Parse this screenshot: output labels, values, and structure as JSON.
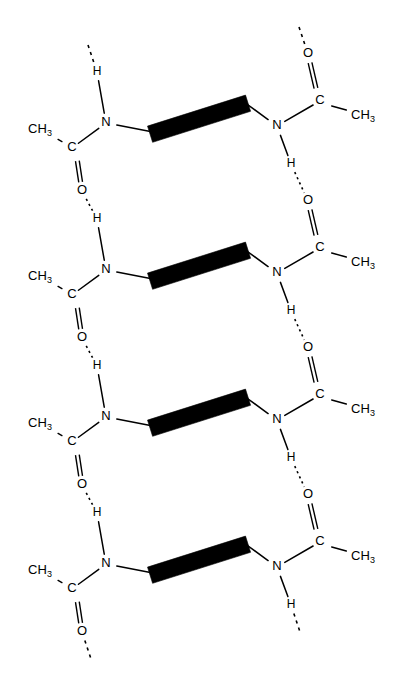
{
  "figure": {
    "background_color": "#ffffff",
    "stroke_color": "#000000",
    "width": 394,
    "height": 698
  },
  "labels": {
    "carbon": "C",
    "nitrogen": "N",
    "oxygen": "O",
    "hydrogen": "H",
    "methyl_stem": "CH",
    "methyl_sub": "3"
  },
  "legend": {
    "bold_bar": "peptide-backbone-bar",
    "dotted_line": "hydrogen-bond",
    "dashed_stub": "chain-continuation"
  },
  "geometry": {
    "unit_period_y": 147,
    "unit_count": 4,
    "left_column_x": 106,
    "right_column_x": 277,
    "bar_left_x": 148,
    "bar_right_x": 248
  },
  "units": [
    {
      "index": 1,
      "left": {
        "n": {
          "x": 106,
          "y": 123,
          "label": "N"
        },
        "h": {
          "x": 97,
          "y": 72,
          "label": "H"
        },
        "c": {
          "x": 72,
          "y": 148,
          "label": "C"
        },
        "ch3": {
          "x": 40,
          "y": 130,
          "label": "CH3"
        },
        "o": {
          "x": 82,
          "y": 191,
          "label": "O"
        }
      },
      "right": {
        "n": {
          "x": 277,
          "y": 126,
          "label": "N"
        },
        "h": {
          "x": 291,
          "y": 164,
          "label": "H"
        },
        "c": {
          "x": 320,
          "y": 101,
          "label": "C"
        },
        "ch3": {
          "x": 363,
          "y": 116,
          "label": "CH3"
        },
        "o": {
          "x": 308,
          "y": 54,
          "label": "O"
        }
      },
      "bar": {
        "x1": 149,
        "y1": 131,
        "x2": 247,
        "y2": 100
      }
    },
    {
      "index": 2,
      "left": {
        "n": {
          "x": 106,
          "y": 270,
          "label": "N"
        },
        "h": {
          "x": 97,
          "y": 219,
          "label": "H"
        },
        "c": {
          "x": 72,
          "y": 295,
          "label": "C"
        },
        "ch3": {
          "x": 40,
          "y": 277,
          "label": "CH3"
        },
        "o": {
          "x": 82,
          "y": 338,
          "label": "O"
        }
      },
      "right": {
        "n": {
          "x": 277,
          "y": 273,
          "label": "N"
        },
        "h": {
          "x": 291,
          "y": 311,
          "label": "H"
        },
        "c": {
          "x": 320,
          "y": 248,
          "label": "C"
        },
        "ch3": {
          "x": 363,
          "y": 263,
          "label": "CH3"
        },
        "o": {
          "x": 308,
          "y": 201,
          "label": "O"
        }
      },
      "bar": {
        "x1": 149,
        "y1": 278,
        "x2": 247,
        "y2": 247
      }
    },
    {
      "index": 3,
      "left": {
        "n": {
          "x": 106,
          "y": 417,
          "label": "N"
        },
        "h": {
          "x": 97,
          "y": 366,
          "label": "H"
        },
        "c": {
          "x": 72,
          "y": 442,
          "label": "C"
        },
        "ch3": {
          "x": 40,
          "y": 424,
          "label": "CH3"
        },
        "o": {
          "x": 82,
          "y": 485,
          "label": "O"
        }
      },
      "right": {
        "n": {
          "x": 277,
          "y": 420,
          "label": "N"
        },
        "h": {
          "x": 291,
          "y": 458,
          "label": "H"
        },
        "c": {
          "x": 320,
          "y": 395,
          "label": "C"
        },
        "ch3": {
          "x": 363,
          "y": 410,
          "label": "CH3"
        },
        "o": {
          "x": 308,
          "y": 348,
          "label": "O"
        }
      },
      "bar": {
        "x1": 149,
        "y1": 425,
        "x2": 247,
        "y2": 394
      }
    },
    {
      "index": 4,
      "left": {
        "n": {
          "x": 106,
          "y": 564,
          "label": "N"
        },
        "h": {
          "x": 97,
          "y": 513,
          "label": "H"
        },
        "c": {
          "x": 72,
          "y": 589,
          "label": "C"
        },
        "ch3": {
          "x": 40,
          "y": 571,
          "label": "CH3"
        },
        "o": {
          "x": 82,
          "y": 632,
          "label": "O"
        }
      },
      "right": {
        "n": {
          "x": 277,
          "y": 567,
          "label": "N"
        },
        "h": {
          "x": 291,
          "y": 605,
          "label": "H"
        },
        "c": {
          "x": 320,
          "y": 542,
          "label": "C"
        },
        "ch3": {
          "x": 363,
          "y": 557,
          "label": "CH3"
        },
        "o": {
          "x": 308,
          "y": 495,
          "label": "O"
        }
      },
      "bar": {
        "x1": 149,
        "y1": 572,
        "x2": 247,
        "y2": 541
      }
    }
  ]
}
